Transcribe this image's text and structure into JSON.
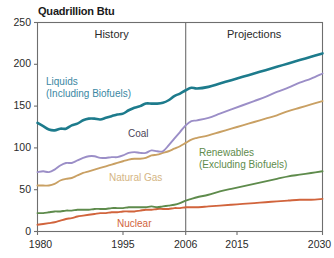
{
  "chart_data": {
    "type": "line",
    "title": "Quadrillion Btu",
    "xlabel": "",
    "ylabel": "Quadrillion Btu",
    "xlim": [
      1980,
      2030
    ],
    "ylim": [
      0,
      250
    ],
    "grid": false,
    "legend_position": "inline-annotations",
    "x_ticks": [
      "1980",
      "1995",
      "2006",
      "2015",
      "2030"
    ],
    "x_tick_values": [
      1980,
      1995,
      2006,
      2015,
      2030
    ],
    "y_ticks": [
      "0",
      "50",
      "100",
      "150",
      "200",
      "250"
    ],
    "y_tick_values": [
      0,
      50,
      100,
      150,
      200,
      250
    ],
    "divider_year": 2006,
    "regions": [
      {
        "label": "History",
        "from": 1980,
        "to": 2006
      },
      {
        "label": "Projections",
        "from": 2006,
        "to": 2030
      }
    ],
    "x": [
      1980,
      1981,
      1982,
      1983,
      1984,
      1985,
      1986,
      1987,
      1988,
      1989,
      1990,
      1991,
      1992,
      1993,
      1994,
      1995,
      1996,
      1997,
      1998,
      1999,
      2000,
      2001,
      2002,
      2003,
      2004,
      2005,
      2006,
      2007,
      2008,
      2010,
      2012,
      2014,
      2016,
      2018,
      2020,
      2022,
      2024,
      2026,
      2028,
      2030
    ],
    "series": [
      {
        "name": "Liquids (Including Biofuels)",
        "label": "Liquids\n(Including Biofuels)",
        "color": "#1D7B8C",
        "values": [
          130,
          126,
          122,
          121,
          123,
          123,
          127,
          129,
          133,
          135,
          135,
          134,
          136,
          138,
          140,
          141,
          145,
          148,
          150,
          153,
          153,
          153,
          154,
          157,
          162,
          165,
          169,
          172,
          171,
          173,
          177,
          181,
          185,
          189,
          193,
          197,
          201,
          205,
          209,
          213
        ]
      },
      {
        "name": "Coal",
        "label": "Coal",
        "color": "#9B8EC7",
        "values": [
          71,
          72,
          71,
          74,
          79,
          82,
          82,
          85,
          88,
          90,
          90,
          88,
          88,
          89,
          89,
          91,
          94,
          95,
          94,
          94,
          97,
          96,
          96,
          103,
          111,
          119,
          127,
          132,
          133,
          136,
          141,
          146,
          151,
          156,
          161,
          167,
          172,
          178,
          183,
          189
        ]
      },
      {
        "name": "Natural Gas",
        "label": "Natural Gas",
        "color": "#C9A063",
        "values": [
          55,
          55,
          55,
          57,
          61,
          63,
          64,
          67,
          70,
          72,
          74,
          76,
          78,
          80,
          82,
          84,
          86,
          87,
          87,
          88,
          91,
          92,
          94,
          96,
          99,
          102,
          106,
          110,
          112,
          115,
          119,
          123,
          127,
          131,
          135,
          139,
          144,
          148,
          152,
          156
        ]
      },
      {
        "name": "Renewables (Excluding Biofuels)",
        "label": "Renewables\n(Excluding Biofuels)",
        "color": "#5E8B4C",
        "values": [
          22,
          22,
          23,
          24,
          24,
          25,
          25,
          26,
          26,
          26,
          27,
          27,
          27,
          28,
          28,
          28,
          29,
          29,
          29,
          29,
          30,
          29,
          30,
          31,
          32,
          34,
          37,
          39,
          41,
          44,
          48,
          51,
          54,
          57,
          60,
          63,
          66,
          68,
          70,
          72
        ]
      },
      {
        "name": "Nuclear",
        "label": "Nuclear",
        "color": "#D1643C",
        "values": [
          8,
          9,
          10,
          11,
          13,
          15,
          16,
          18,
          19,
          20,
          21,
          22,
          22,
          23,
          23,
          24,
          24,
          24,
          25,
          26,
          26,
          27,
          27,
          27,
          28,
          28,
          29,
          29,
          29,
          30,
          31,
          32,
          33,
          34,
          35,
          36,
          37,
          38,
          38,
          39
        ]
      }
    ],
    "annotations": [
      {
        "name": "liquids-label",
        "text": "Liquids",
        "text2": "(Including Biofuels)",
        "color": "#3A87A3",
        "x": 46,
        "y": 76
      },
      {
        "name": "coal-label",
        "text": "Coal",
        "text2": "",
        "color": "#4C4457",
        "x": 128,
        "y": 128
      },
      {
        "name": "natural-gas-label",
        "text": "Natural Gas",
        "text2": "",
        "color": "#D4B584",
        "x": 109,
        "y": 172
      },
      {
        "name": "renewables-label",
        "text": "Renewables",
        "text2": "(Excluding Biofuels)",
        "color": "#5E8B4C",
        "x": 199,
        "y": 147
      },
      {
        "name": "nuclear-label",
        "text": "Nuclear",
        "text2": "",
        "color": "#D1643C",
        "x": 117,
        "y": 218
      }
    ],
    "axis_color": "#6E6E6E",
    "text_color": "#2a2a2a"
  }
}
